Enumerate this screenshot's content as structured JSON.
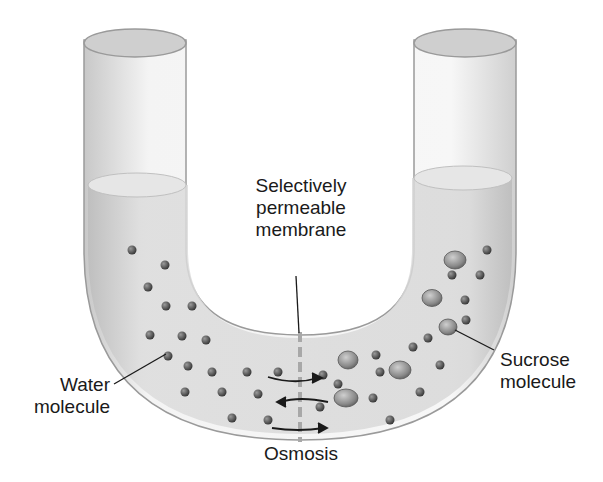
{
  "diagram": {
    "labels": {
      "membrane": [
        "Selectively",
        "permeable",
        "membrane"
      ],
      "water": [
        "Water",
        "molecule"
      ],
      "sucrose": [
        "Sucrose",
        "molecule"
      ],
      "process": "Osmosis"
    },
    "colors": {
      "tube_glass": "#f2f2f2",
      "tube_edge": "#9a9a9a",
      "solution": "#d4d4d4",
      "water_molecule": "#4a4a4a",
      "sucrose_molecule": "#8c8c8c",
      "membrane": "#a8a8a8",
      "arrow_dark": "#333333"
    },
    "components": [
      {
        "name": "U-tube",
        "role": "container"
      },
      {
        "name": "Selectively permeable membrane",
        "role": "barrier at bottom center"
      },
      {
        "name": "Water molecule",
        "role": "small particle, crosses membrane"
      },
      {
        "name": "Sucrose molecule",
        "role": "large particle, right side only"
      },
      {
        "name": "Osmosis arrow",
        "role": "net water flow left to right"
      }
    ],
    "flow_arrows": [
      {
        "direction": "right"
      },
      {
        "direction": "left"
      },
      {
        "direction": "right"
      }
    ]
  }
}
